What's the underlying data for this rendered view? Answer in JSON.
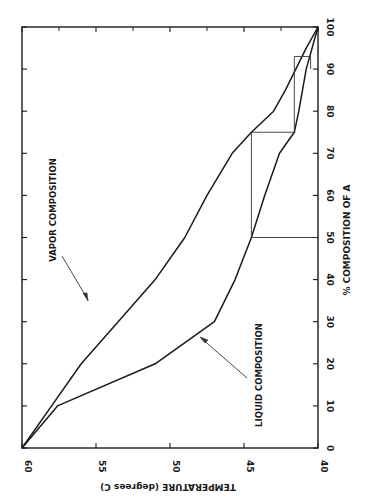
{
  "chart_data": {
    "type": "line",
    "title": "",
    "orientation": "rotated 90 degrees clockwise (temperature runs horizontally, composition vertically)",
    "xlabel": "TEMPERATURE (degrees C)",
    "ylabel": "% COMPOSITION OF A",
    "temperature_axis": {
      "range": [
        60,
        40
      ],
      "ticks": [
        60,
        55,
        50,
        45,
        40
      ],
      "minor_ticks": [
        57.5,
        52.5,
        47.5,
        42.5
      ]
    },
    "composition_axis": {
      "range": [
        0,
        100
      ],
      "ticks": [
        0,
        10,
        20,
        30,
        40,
        50,
        60,
        70,
        80,
        90,
        100
      ]
    },
    "grid": false,
    "series": [
      {
        "name": "VAPOR COMPOSITION",
        "points": [
          [
            60,
            0
          ],
          [
            58,
            10
          ],
          [
            56,
            20
          ],
          [
            53.5,
            30
          ],
          [
            51,
            40
          ],
          [
            49,
            50
          ],
          [
            47.5,
            60
          ],
          [
            45.8,
            70
          ],
          [
            44.5,
            75
          ],
          [
            43,
            80
          ],
          [
            42.2,
            85
          ],
          [
            41.5,
            90
          ],
          [
            40.8,
            95
          ],
          [
            40,
            100
          ]
        ]
      },
      {
        "name": "LIQUID COMPOSITION",
        "points": [
          [
            60,
            0
          ],
          [
            57.6,
            10
          ],
          [
            51,
            20
          ],
          [
            47,
            30
          ],
          [
            45.6,
            40
          ],
          [
            44.5,
            50
          ],
          [
            43.6,
            60
          ],
          [
            42.6,
            70
          ],
          [
            41.6,
            75
          ],
          [
            41.3,
            80
          ],
          [
            40.8,
            90
          ],
          [
            40,
            100
          ]
        ]
      }
    ],
    "step_construction": [
      {
        "from": [
          44.5,
          50
        ],
        "to": [
          40,
          50
        ],
        "kind": "horizontal"
      },
      {
        "from": [
          44.5,
          50
        ],
        "to": [
          44.5,
          75
        ],
        "kind": "vertical"
      },
      {
        "from": [
          44.5,
          75
        ],
        "to": [
          41.6,
          75
        ],
        "kind": "horizontal"
      },
      {
        "from": [
          41.6,
          75
        ],
        "to": [
          41.6,
          93
        ],
        "kind": "vertical"
      },
      {
        "from": [
          41.6,
          93
        ],
        "to": [
          40.5,
          93
        ],
        "kind": "horizontal"
      },
      {
        "from": [
          40.5,
          93
        ],
        "to": [
          40.5,
          90
        ],
        "kind": "vertical"
      }
    ],
    "annotations": [
      {
        "text": "VAPOR COMPOSITION",
        "arrow_to_series": "VAPOR COMPOSITION"
      },
      {
        "text": "LIQUID COMPOSITION",
        "arrow_to_series": "LIQUID COMPOSITION"
      }
    ]
  },
  "labels": {
    "x_title": "TEMPERATURE (degrees C)",
    "y_title": "% COMPOSITION OF A",
    "vapor": "VAPOR COMPOSITION",
    "liquid": "LIQUID COMPOSITION"
  },
  "colors": {
    "line": "#1a1a1a",
    "background": "#ffffff"
  }
}
